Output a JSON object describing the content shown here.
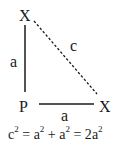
{
  "diagram": {
    "vertices": {
      "top": "X",
      "corner": "P",
      "right": "X"
    },
    "sides": {
      "vertical": "a",
      "horizontal": "a",
      "hypotenuse": "c"
    },
    "equation": {
      "lhs_base": "c",
      "exp": "2",
      "eq1": " = ",
      "t1_base": "a",
      "plus": " + ",
      "t2_base": "a",
      "eq2": " = 2",
      "t3_base": "a"
    },
    "line_color": "#1a1a1a"
  }
}
